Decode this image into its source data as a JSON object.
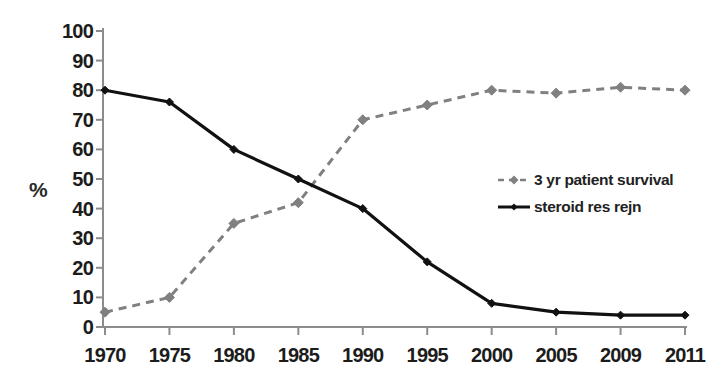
{
  "chart_data": {
    "type": "line",
    "title": "",
    "subtitle": "",
    "xlabel": "",
    "ylabel": "%",
    "categories": [
      "1970",
      "1975",
      "1980",
      "1985",
      "1990",
      "1995",
      "2000",
      "2005",
      "2009",
      "2011"
    ],
    "ylim": [
      0,
      100
    ],
    "ytick_labels": [
      "0",
      "10",
      "20",
      "30",
      "40",
      "50",
      "60",
      "70",
      "80",
      "90",
      "100"
    ],
    "ytick_values": [
      0,
      10,
      20,
      30,
      40,
      50,
      60,
      70,
      80,
      90,
      100
    ],
    "grid": false,
    "legend_position": "center-right",
    "series": [
      {
        "name": "3 yr patient survival",
        "values": [
          5,
          10,
          35,
          42,
          70,
          75,
          80,
          79,
          81,
          80
        ],
        "color": "#808080",
        "line_style": "dashed",
        "marker": "diamond"
      },
      {
        "name": "steroid res rejn",
        "values": [
          80,
          76,
          60,
          50,
          40,
          22,
          8,
          5,
          4,
          4
        ],
        "color": "#111111",
        "line_style": "solid",
        "marker": "diamond"
      }
    ],
    "annotations": []
  },
  "legend": {
    "items": [
      {
        "label": "3 yr patient survival",
        "icon": "dashed-line-diamond-marker-icon"
      },
      {
        "label": "steroid res rejn",
        "icon": "solid-line-diamond-marker-icon"
      }
    ]
  },
  "axes": {
    "y_axis_title": "%",
    "axis_color": "#8c8c8c",
    "tick_label_color": "#1c1c1c"
  }
}
